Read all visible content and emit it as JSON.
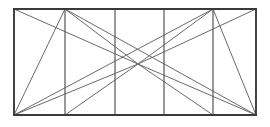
{
  "figure": {
    "type": "line-diagram",
    "canvas": {
      "width": 270,
      "height": 127
    },
    "background_color": "#ffffff",
    "colors": {
      "frame": "#3a3a3c",
      "divider": "#5c5c5e",
      "diagonal": "#6a6a6c"
    },
    "rectangle": {
      "left": 14,
      "top": 9,
      "right": 256,
      "bottom": 115,
      "width": 242,
      "height": 106
    },
    "center_point": {
      "x": 138,
      "y": 64
    },
    "vertical_lines_x": [
      14,
      65,
      115,
      164,
      213,
      256
    ],
    "interior_vertical_count": 4,
    "panel_count": 5,
    "frame_segments": [
      {
        "name": "top-edge",
        "x1": 14,
        "y1": 9,
        "x2": 256,
        "y2": 9
      },
      {
        "name": "bottom-edge",
        "x1": 14,
        "y1": 115,
        "x2": 256,
        "y2": 115
      },
      {
        "name": "left-edge",
        "x1": 14,
        "y1": 9,
        "x2": 14,
        "y2": 115
      },
      {
        "name": "right-edge",
        "x1": 256,
        "y1": 9,
        "x2": 256,
        "y2": 115
      }
    ],
    "divider_segments": [
      {
        "name": "divider-1",
        "x1": 65,
        "y1": 9,
        "x2": 65,
        "y2": 115
      },
      {
        "name": "divider-2",
        "x1": 115,
        "y1": 9,
        "x2": 115,
        "y2": 115
      },
      {
        "name": "divider-3",
        "x1": 164,
        "y1": 9,
        "x2": 164,
        "y2": 115
      },
      {
        "name": "divider-4",
        "x1": 213,
        "y1": 9,
        "x2": 213,
        "y2": 115
      }
    ],
    "diagonal_segments": [
      {
        "name": "topleft-to-center",
        "x1": 14,
        "y1": 9,
        "x2": 138,
        "y2": 64
      },
      {
        "name": "bottomleft-to-center",
        "x1": 14,
        "y1": 115,
        "x2": 138,
        "y2": 64
      },
      {
        "name": "topright-to-center",
        "x1": 256,
        "y1": 9,
        "x2": 138,
        "y2": 64
      },
      {
        "name": "bottomright-to-center",
        "x1": 256,
        "y1": 115,
        "x2": 138,
        "y2": 64
      },
      {
        "name": "divider1-top-to-center",
        "x1": 65,
        "y1": 9,
        "x2": 138,
        "y2": 64
      },
      {
        "name": "divider1-bottom-to-center",
        "x1": 65,
        "y1": 115,
        "x2": 138,
        "y2": 64
      },
      {
        "name": "divider4-top-to-center",
        "x1": 213,
        "y1": 9,
        "x2": 138,
        "y2": 64
      },
      {
        "name": "divider4-bottom-to-center",
        "x1": 213,
        "y1": 115,
        "x2": 138,
        "y2": 64
      },
      {
        "name": "panel1-diagonal",
        "x1": 65,
        "y1": 9,
        "x2": 14,
        "y2": 115
      },
      {
        "name": "panel5-diagonal",
        "x1": 213,
        "y1": 9,
        "x2": 256,
        "y2": 115
      },
      {
        "name": "divider1-top-to-bottomright",
        "x1": 65,
        "y1": 9,
        "x2": 256,
        "y2": 115
      },
      {
        "name": "divider4-top-to-bottomleft",
        "x1": 213,
        "y1": 9,
        "x2": 14,
        "y2": 115
      }
    ]
  }
}
